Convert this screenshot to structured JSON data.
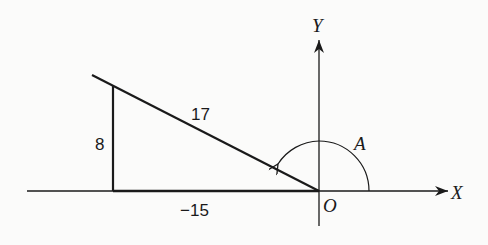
{
  "diagram": {
    "type": "trigonometry-reference-triangle",
    "axes": {
      "x_label": "X",
      "y_label": "Y",
      "origin_label": "O"
    },
    "angle": {
      "label": "A",
      "description": "angle measured counterclockwise from positive X axis to terminal side in quadrant II"
    },
    "triangle": {
      "hypotenuse_label": "17",
      "vertical_leg_label": "8",
      "horizontal_leg_label": "−15"
    },
    "colors": {
      "line": "#1a1a1a",
      "background": "#fbfbfa"
    }
  }
}
